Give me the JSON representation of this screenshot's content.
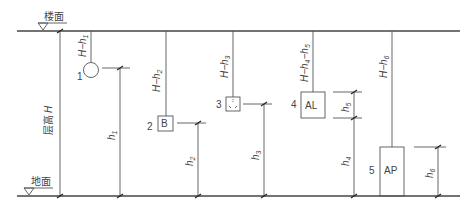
{
  "diagram": {
    "levels": {
      "floor_label": "楼面",
      "ground_label": "地面",
      "storey_height_label": "层高",
      "storey_height_symbol": "H"
    },
    "items": [
      {
        "number": "1",
        "symbol": "circle",
        "top_label": "H−h",
        "top_sub": "1",
        "dim_label": "h",
        "dim_sub": "1"
      },
      {
        "number": "2",
        "symbol": "box-B",
        "box_text": "B",
        "top_label": "H−h",
        "top_sub": "2",
        "dim_label": "h",
        "dim_sub": "2"
      },
      {
        "number": "3",
        "symbol": "socket-box",
        "top_label": "H−h",
        "top_sub": "3",
        "dim_label": "h",
        "dim_sub": "3"
      },
      {
        "number": "4",
        "symbol": "box-AL",
        "box_text": "AL",
        "top_label": "H−h",
        "top_sub": "4",
        "top_label_2": "−h",
        "top_sub_2": "5",
        "dim_label": "h",
        "dim_sub": "4",
        "dim2_label": "h",
        "dim2_sub": "5"
      },
      {
        "number": "5",
        "symbol": "box-AP",
        "box_text": "AP",
        "top_label": "H−h",
        "top_sub": "6",
        "dim_label": "h",
        "dim_sub": "6"
      }
    ],
    "colors": {
      "line": "#555555",
      "text": "#444444",
      "background": "#ffffff"
    }
  }
}
